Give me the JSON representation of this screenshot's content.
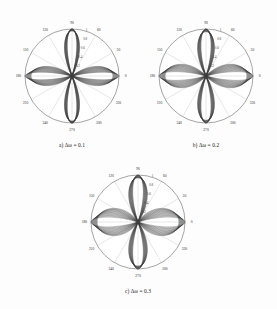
{
  "figure": {
    "background_color": "#fdfdfd",
    "curve_color": "#3b3b3b",
    "grid_color": "#b9b9b9",
    "outline_color": "#5a5a5a"
  },
  "panels": [
    {
      "id": "panel-a",
      "caption": "a) Δω = 0.1",
      "delta_omega": 0.1
    },
    {
      "id": "panel-b",
      "caption": "b) Δω = 0.2",
      "delta_omega": 0.2
    },
    {
      "id": "panel-c",
      "caption": "c) Δω = 0.3",
      "delta_omega": 0.3
    }
  ],
  "chart_data": [
    {
      "type": "line",
      "projection": "polar",
      "title": "a) Δω = 0.1",
      "xlabel": "angle (degrees)",
      "ylabel": "normalized amplitude",
      "angle_unit": "degrees",
      "angle_ticks": [
        0,
        30,
        60,
        90,
        120,
        150,
        180,
        210,
        240,
        270,
        300,
        330
      ],
      "angle_tick_labels": [
        "0",
        "30",
        "60",
        "90",
        "120",
        "150",
        "180",
        "210",
        "240",
        "270",
        "300",
        "330"
      ],
      "radial_ticks": [
        0.2,
        0.4,
        0.6,
        0.8,
        1.0
      ],
      "radial_tick_labels": [
        "0.2",
        "0.4",
        "0.6",
        "0.8",
        "1"
      ],
      "rlim": [
        0,
        1
      ],
      "grid": true,
      "legend": false,
      "series_count": 14,
      "lobes": 4,
      "lobe_axes_deg": [
        0,
        90,
        180,
        270
      ],
      "delta_omega": 0.1,
      "description": "Four-lobed clover pattern; vertical lobes (90/270) remain narrow and nearly overlapping, horizontal lobes (0/180) broaden into a dense fan as the sweep parameter increases.",
      "series": [
        {
          "name": "k = 1",
          "lobe_width_deg": 26,
          "horiz_peak": 1.0,
          "vert_peak": 1.0
        },
        {
          "name": "k = 2",
          "lobe_width_deg": 29,
          "horiz_peak": 0.99,
          "vert_peak": 1.0
        },
        {
          "name": "k = 3",
          "lobe_width_deg": 33,
          "horiz_peak": 0.98,
          "vert_peak": 1.0
        },
        {
          "name": "k = 4",
          "lobe_width_deg": 37,
          "horiz_peak": 0.97,
          "vert_peak": 0.99
        },
        {
          "name": "k = 5",
          "lobe_width_deg": 41,
          "horiz_peak": 0.96,
          "vert_peak": 0.99
        },
        {
          "name": "k = 6",
          "lobe_width_deg": 45,
          "horiz_peak": 0.95,
          "vert_peak": 0.99
        },
        {
          "name": "k = 7",
          "lobe_width_deg": 49,
          "horiz_peak": 0.94,
          "vert_peak": 0.98
        },
        {
          "name": "k = 8",
          "lobe_width_deg": 53,
          "horiz_peak": 0.93,
          "vert_peak": 0.98
        },
        {
          "name": "k = 9",
          "lobe_width_deg": 57,
          "horiz_peak": 0.92,
          "vert_peak": 0.98
        },
        {
          "name": "k = 10",
          "lobe_width_deg": 61,
          "horiz_peak": 0.91,
          "vert_peak": 0.97
        },
        {
          "name": "k = 11",
          "lobe_width_deg": 65,
          "horiz_peak": 0.9,
          "vert_peak": 0.97
        },
        {
          "name": "k = 12",
          "lobe_width_deg": 69,
          "horiz_peak": 0.89,
          "vert_peak": 0.97
        },
        {
          "name": "k = 13",
          "lobe_width_deg": 73,
          "horiz_peak": 0.88,
          "vert_peak": 0.96
        },
        {
          "name": "k = 14",
          "lobe_width_deg": 77,
          "horiz_peak": 0.87,
          "vert_peak": 0.96
        }
      ]
    },
    {
      "type": "line",
      "projection": "polar",
      "title": "b) Δω = 0.2",
      "xlabel": "angle (degrees)",
      "ylabel": "normalized amplitude",
      "angle_unit": "degrees",
      "angle_ticks": [
        0,
        30,
        60,
        90,
        120,
        150,
        180,
        210,
        240,
        270,
        300,
        330
      ],
      "angle_tick_labels": [
        "0",
        "30",
        "60",
        "90",
        "120",
        "150",
        "180",
        "210",
        "240",
        "270",
        "300",
        "330"
      ],
      "radial_ticks": [
        0.2,
        0.4,
        0.6,
        0.8,
        1.0
      ],
      "radial_tick_labels": [
        "0.2",
        "0.4",
        "0.6",
        "0.8",
        "1"
      ],
      "rlim": [
        0,
        1
      ],
      "grid": true,
      "legend": false,
      "series_count": 14,
      "lobes": 4,
      "lobe_axes_deg": [
        0,
        90,
        180,
        270
      ],
      "delta_omega": 0.2,
      "description": "Same four-lobed family with wider angular spread than panel a); horizontal lobes form wide nested loops reaching the outer circle.",
      "series": [
        {
          "name": "k = 1",
          "lobe_width_deg": 30,
          "horiz_peak": 1.0,
          "vert_peak": 1.0
        },
        {
          "name": "k = 2",
          "lobe_width_deg": 35,
          "horiz_peak": 0.99,
          "vert_peak": 1.0
        },
        {
          "name": "k = 3",
          "lobe_width_deg": 40,
          "horiz_peak": 0.98,
          "vert_peak": 0.99
        },
        {
          "name": "k = 4",
          "lobe_width_deg": 45,
          "horiz_peak": 0.97,
          "vert_peak": 0.99
        },
        {
          "name": "k = 5",
          "lobe_width_deg": 50,
          "horiz_peak": 0.96,
          "vert_peak": 0.99
        },
        {
          "name": "k = 6",
          "lobe_width_deg": 55,
          "horiz_peak": 0.95,
          "vert_peak": 0.98
        },
        {
          "name": "k = 7",
          "lobe_width_deg": 60,
          "horiz_peak": 0.94,
          "vert_peak": 0.98
        },
        {
          "name": "k = 8",
          "lobe_width_deg": 65,
          "horiz_peak": 0.93,
          "vert_peak": 0.97
        },
        {
          "name": "k = 9",
          "lobe_width_deg": 70,
          "horiz_peak": 0.92,
          "vert_peak": 0.97
        },
        {
          "name": "k = 10",
          "lobe_width_deg": 75,
          "horiz_peak": 0.91,
          "vert_peak": 0.96
        },
        {
          "name": "k = 11",
          "lobe_width_deg": 80,
          "horiz_peak": 0.9,
          "vert_peak": 0.96
        },
        {
          "name": "k = 12",
          "lobe_width_deg": 85,
          "horiz_peak": 0.89,
          "vert_peak": 0.95
        },
        {
          "name": "k = 13",
          "lobe_width_deg": 90,
          "horiz_peak": 0.88,
          "vert_peak": 0.95
        },
        {
          "name": "k = 14",
          "lobe_width_deg": 95,
          "horiz_peak": 0.87,
          "vert_peak": 0.94
        }
      ]
    },
    {
      "type": "line",
      "projection": "polar",
      "title": "c) Δω = 0.3",
      "xlabel": "angle (degrees)",
      "ylabel": "normalized amplitude",
      "angle_unit": "degrees",
      "angle_ticks": [
        0,
        30,
        60,
        90,
        120,
        150,
        180,
        210,
        240,
        270,
        300,
        330
      ],
      "angle_tick_labels": [
        "0",
        "30",
        "60",
        "90",
        "120",
        "150",
        "180",
        "210",
        "240",
        "270",
        "300",
        "330"
      ],
      "radial_ticks": [
        0.2,
        0.4,
        0.6,
        0.8,
        1.0
      ],
      "radial_tick_labels": [
        "0.2",
        "0.4",
        "0.6",
        "0.8",
        "1"
      ],
      "rlim": [
        0,
        1
      ],
      "grid": true,
      "legend": false,
      "series_count": 14,
      "lobes": 4,
      "lobe_axes_deg": [
        0,
        90,
        180,
        270
      ],
      "delta_omega": 0.3,
      "description": "Widest angular spread of the three panels; the nested horizontal loops fill most of the disc and the vertical lobes remain a narrow overlapping bundle.",
      "series": [
        {
          "name": "k = 1",
          "lobe_width_deg": 34,
          "horiz_peak": 1.0,
          "vert_peak": 1.0
        },
        {
          "name": "k = 2",
          "lobe_width_deg": 40,
          "horiz_peak": 0.99,
          "vert_peak": 1.0
        },
        {
          "name": "k = 3",
          "lobe_width_deg": 46,
          "horiz_peak": 0.98,
          "vert_peak": 0.99
        },
        {
          "name": "k = 4",
          "lobe_width_deg": 52,
          "horiz_peak": 0.97,
          "vert_peak": 0.99
        },
        {
          "name": "k = 5",
          "lobe_width_deg": 58,
          "horiz_peak": 0.96,
          "vert_peak": 0.98
        },
        {
          "name": "k = 6",
          "lobe_width_deg": 64,
          "horiz_peak": 0.95,
          "vert_peak": 0.98
        },
        {
          "name": "k = 7",
          "lobe_width_deg": 70,
          "horiz_peak": 0.94,
          "vert_peak": 0.97
        },
        {
          "name": "k = 8",
          "lobe_width_deg": 76,
          "horiz_peak": 0.93,
          "vert_peak": 0.97
        },
        {
          "name": "k = 9",
          "lobe_width_deg": 82,
          "horiz_peak": 0.92,
          "vert_peak": 0.96
        },
        {
          "name": "k = 10",
          "lobe_width_deg": 88,
          "horiz_peak": 0.91,
          "vert_peak": 0.96
        },
        {
          "name": "k = 11",
          "lobe_width_deg": 94,
          "horiz_peak": 0.9,
          "vert_peak": 0.95
        },
        {
          "name": "k = 12",
          "lobe_width_deg": 100,
          "horiz_peak": 0.89,
          "vert_peak": 0.95
        },
        {
          "name": "k = 13",
          "lobe_width_deg": 106,
          "horiz_peak": 0.88,
          "vert_peak": 0.94
        },
        {
          "name": "k = 14",
          "lobe_width_deg": 112,
          "horiz_peak": 0.87,
          "vert_peak": 0.94
        }
      ]
    }
  ]
}
